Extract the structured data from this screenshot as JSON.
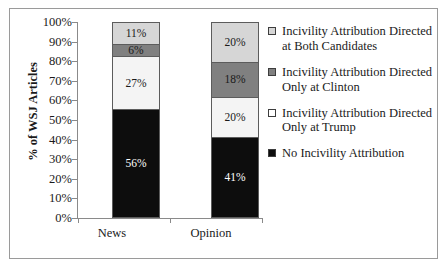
{
  "chart_data": {
    "type": "bar",
    "subtype": "stacked-bar-100",
    "title": "",
    "xlabel": "",
    "ylabel": "% of WSJ Articles",
    "ylim": [
      0,
      100
    ],
    "ytick_labels": [
      "100%",
      "90%",
      "80%",
      "70%",
      "60%",
      "50%",
      "40%",
      "30%",
      "20%",
      "10%",
      "0%"
    ],
    "ytick_values": [
      100,
      90,
      80,
      70,
      60,
      50,
      40,
      30,
      20,
      10,
      0
    ],
    "grid": false,
    "legend_position": "right",
    "categories": [
      "News",
      "Opinion"
    ],
    "series": [
      {
        "name": "No Incivility Attribution",
        "values": [
          56,
          41
        ],
        "labels": [
          "56%",
          "41%"
        ],
        "color": "#0d0d0d",
        "label_color": "#ffffff"
      },
      {
        "name": "Incivility Attribution Directed Only at Trump",
        "values": [
          27,
          20
        ],
        "labels": [
          "27%",
          "20%"
        ],
        "color": "#f4f4f4",
        "label_color": "#1a1a1a"
      },
      {
        "name": "Incivility Attribution Directed Only at Clinton",
        "values": [
          6,
          18
        ],
        "labels": [
          "6%",
          "18%"
        ],
        "color": "#808080",
        "label_color": "#1a1a1a"
      },
      {
        "name": "Incivility Attribution Directed at Both Candidates",
        "values": [
          11,
          20
        ],
        "labels": [
          "11%",
          "20%"
        ],
        "color": "#d6d6d6",
        "label_color": "#1a1a1a"
      }
    ]
  },
  "legend": {
    "entries": [
      {
        "label": "Incivility Attribution Directed at Both Candidates",
        "swatch_color": "#d6d6d6"
      },
      {
        "label": "Incivility Attribution Directed Only at Clinton",
        "swatch_color": "#808080"
      },
      {
        "label": "Incivility Attribution Directed Only at Trump",
        "swatch_color": "#ffffff"
      },
      {
        "label": "No Incivility Attribution",
        "swatch_color": "#0d0d0d"
      }
    ]
  },
  "axes": {
    "y_title": "% of WSJ Articles"
  }
}
